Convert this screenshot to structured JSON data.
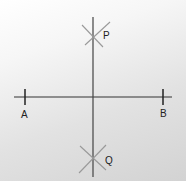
{
  "diagram": {
    "type": "perpendicular-bisector-construction",
    "points": {
      "A": {
        "label": "A",
        "x": 25,
        "y": 97
      },
      "B": {
        "label": "B",
        "x": 163,
        "y": 97
      },
      "P": {
        "label": "P",
        "x": 93,
        "y": 35
      },
      "Q": {
        "label": "Q",
        "x": 93,
        "y": 158
      }
    },
    "colors": {
      "line": "#333333",
      "arc": "#888888",
      "label": "#222222"
    }
  }
}
